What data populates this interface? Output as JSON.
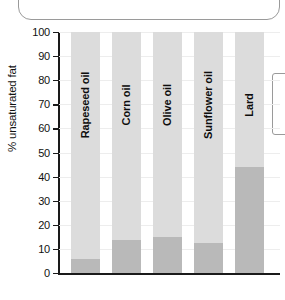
{
  "decorations": {
    "callout_box": "rounded-callout-cropped",
    "legend_box": "legend-box-cropped"
  },
  "chart_data": {
    "type": "bar",
    "subtype": "stacked-bar",
    "title": "",
    "xlabel": "",
    "ylabel": "% unsaturated fat",
    "ylim": [
      0,
      100
    ],
    "ytick_step": 10,
    "yticks": [
      0,
      10,
      20,
      30,
      40,
      50,
      60,
      70,
      80,
      90,
      100
    ],
    "ytick_labels": [
      "0",
      "10",
      "20",
      "30",
      "40",
      "50",
      "60",
      "70",
      "80",
      "90",
      "100"
    ],
    "grid": true,
    "grid_axis": "y",
    "legend": false,
    "legend_position": "none",
    "categories": [
      "Rapeseed oil",
      "Corn oil",
      "Olive oil",
      "Sunflower oil",
      "Lard"
    ],
    "series": [
      {
        "name": "saturated",
        "color": "#b9b9b9",
        "values": [
          6,
          13.5,
          15,
          12.5,
          44
        ]
      },
      {
        "name": "unsaturated",
        "color": "#dcdcdc",
        "values": [
          94,
          86.5,
          85,
          87.5,
          56
        ]
      }
    ],
    "bar_total": 100,
    "colors": {
      "bar_light": "#dcdcdc",
      "bar_dark": "#b9b9b9",
      "axis": "#1a1a1a",
      "gridline": "#ededed",
      "text": "#111111",
      "box_border": "#9a9a9a"
    }
  }
}
